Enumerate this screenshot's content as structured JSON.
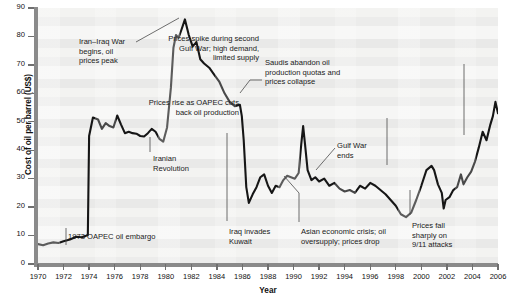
{
  "chart_data": {
    "type": "line",
    "title": "",
    "xlabel": "Year",
    "ylabel": "Cost of oil per barrel (US$)",
    "xlim": [
      1970,
      2006
    ],
    "ylim": [
      0,
      90
    ],
    "grid": false,
    "legend": "none",
    "xticks": [
      1970,
      1972,
      1974,
      1976,
      1978,
      1980,
      1982,
      1984,
      1986,
      1988,
      1990,
      1992,
      1994,
      1996,
      1998,
      2000,
      2002,
      2004,
      2006
    ],
    "yticks": [
      0,
      10,
      20,
      30,
      40,
      50,
      60,
      70,
      80,
      90
    ],
    "series": [
      {
        "name": "Cost of oil per barrel (US$)",
        "x": [
          1970.0,
          1970.4,
          1970.8,
          1971.2,
          1971.6,
          1972.0,
          1972.5,
          1973.0,
          1973.4,
          1973.7,
          1973.8,
          1973.9,
          1974.0,
          1974.3,
          1974.7,
          1975.0,
          1975.3,
          1975.6,
          1975.9,
          1976.2,
          1976.5,
          1976.8,
          1977.1,
          1977.4,
          1977.7,
          1978.0,
          1978.3,
          1978.6,
          1978.9,
          1979.2,
          1979.5,
          1979.8,
          1980.1,
          1980.4,
          1980.6,
          1980.8,
          1981.0,
          1981.2,
          1981.5,
          1981.8,
          1982.1,
          1982.4,
          1982.7,
          1983.0,
          1983.4,
          1983.8,
          1984.2,
          1984.6,
          1985.0,
          1985.4,
          1985.8,
          1985.95,
          1986.1,
          1986.3,
          1986.5,
          1986.8,
          1987.1,
          1987.4,
          1987.7,
          1988.0,
          1988.3,
          1988.6,
          1988.9,
          1989.2,
          1989.5,
          1989.8,
          1990.1,
          1990.4,
          1990.6,
          1990.75,
          1990.9,
          1991.1,
          1991.4,
          1991.7,
          1992.0,
          1992.4,
          1992.8,
          1993.2,
          1993.6,
          1994.0,
          1994.4,
          1994.8,
          1995.2,
          1995.6,
          1996.0,
          1996.4,
          1996.8,
          1997.2,
          1997.6,
          1998.0,
          1998.4,
          1998.8,
          1999.2,
          1999.6,
          2000.0,
          2000.4,
          2000.8,
          2001.0,
          2001.3,
          2001.6,
          2001.75,
          2001.9,
          2002.2,
          2002.5,
          2002.8,
          2003.1,
          2003.3,
          2003.6,
          2003.9,
          2004.2,
          2004.5,
          2004.8,
          2005.1,
          2005.4,
          2005.6,
          2005.8,
          2006.0
        ],
        "y": [
          7.0,
          6.6,
          7.2,
          7.6,
          7.4,
          8.0,
          8.6,
          9.6,
          9.4,
          9.8,
          10.0,
          10.2,
          45.0,
          51.5,
          50.8,
          47.5,
          49.5,
          48.5,
          48.0,
          52.2,
          49.0,
          46.0,
          46.5,
          46.0,
          45.8,
          45.0,
          44.8,
          46.0,
          47.5,
          46.5,
          44.0,
          43.0,
          48.0,
          62.0,
          76.0,
          80.5,
          79.5,
          82.0,
          86.0,
          80.5,
          76.5,
          78.0,
          72.0,
          70.5,
          69.0,
          66.5,
          64.0,
          60.0,
          57.0,
          55.5,
          56.0,
          52.0,
          43.5,
          27.0,
          21.5,
          24.5,
          27.0,
          30.5,
          31.5,
          27.5,
          25.0,
          27.5,
          27.0,
          29.5,
          31.0,
          30.5,
          30.0,
          32.0,
          42.0,
          48.5,
          42.0,
          33.0,
          29.5,
          30.5,
          29.0,
          30.0,
          27.5,
          28.5,
          26.5,
          25.5,
          26.0,
          25.0,
          27.5,
          26.5,
          28.5,
          27.5,
          26.0,
          24.5,
          22.5,
          20.5,
          17.5,
          16.5,
          18.0,
          22.5,
          27.5,
          33.0,
          34.5,
          33.0,
          28.0,
          25.0,
          19.5,
          22.5,
          23.5,
          26.0,
          27.0,
          31.5,
          28.0,
          30.5,
          32.5,
          36.0,
          41.0,
          46.5,
          43.5,
          49.0,
          52.0,
          57.0,
          53.0
        ],
        "color": "#161616"
      }
    ],
    "annotations": [
      {
        "id": "oapec-embargo-1973",
        "text": "1973 OAPEC oil embargo",
        "align": "left",
        "label_x": 68,
        "label_y": 232,
        "leader": [
          [
            66,
            228
          ],
          [
            66,
            245
          ]
        ]
      },
      {
        "id": "iran-iraq-war",
        "text": "Iran–Iraq War\nbegins, oil\nprices peak",
        "align": "left",
        "label_x": 79,
        "label_y": 37,
        "leader": [
          [
            136,
            42
          ],
          [
            179,
            18
          ]
        ]
      },
      {
        "id": "iranian-revolution",
        "text": "Iranian\nRevolution",
        "align": "left",
        "label_x": 153,
        "label_y": 154,
        "leader": [
          [
            150,
            137
          ],
          [
            150,
            152
          ]
        ]
      },
      {
        "id": "saudis-abandon-quotas",
        "text": "Saudis abandon oil\nproduction quotas and\nprices collapse",
        "align": "left",
        "label_x": 265,
        "label_y": 58,
        "leader": [
          [
            240,
            93
          ],
          [
            250,
            80
          ],
          [
            262,
            80
          ]
        ]
      },
      {
        "id": "iraq-invades-kuwait",
        "text": "Iraq invades\nKuwait",
        "align": "left",
        "label_x": 229,
        "label_y": 227,
        "leader": [
          [
            227,
            221
          ],
          [
            227,
            133
          ]
        ]
      },
      {
        "id": "gulf-war-ends",
        "text": "Gulf War\nends",
        "align": "left",
        "label_x": 337,
        "label_y": 141,
        "leader": [
          [
            335,
            148
          ],
          [
            316,
            170
          ]
        ]
      },
      {
        "id": "asian-economic-crisis",
        "text": "Asian economic crisis; oil\noversupply; prices drop",
        "align": "left",
        "label_x": 301,
        "label_y": 227,
        "leader": [
          [
            299,
            222
          ],
          [
            299,
            193
          ],
          [
            284,
            176
          ]
        ]
      },
      {
        "id": "oapec-cuts-production",
        "text": "Prices rise as OAPEC cuts\nback oil production",
        "align": "right",
        "label_x": 239,
        "label_y": 98,
        "leader": [
          [
            387,
            118
          ],
          [
            387,
            165
          ]
        ]
      },
      {
        "id": "second-gulf-war-spike",
        "text": "Prices spike during second\nGulf War; high demand,\nlimited supply",
        "align": "right",
        "label_x": 259,
        "label_y": 34,
        "leader": [
          [
            464,
            64
          ],
          [
            464,
            135
          ]
        ]
      },
      {
        "id": "nine-eleven-attacks",
        "text": "Prices fall\nsharply on\n9/11 attacks",
        "align": "left",
        "label_x": 412,
        "label_y": 221,
        "leader": [
          [
            410,
            215
          ],
          [
            410,
            190
          ]
        ]
      }
    ]
  }
}
